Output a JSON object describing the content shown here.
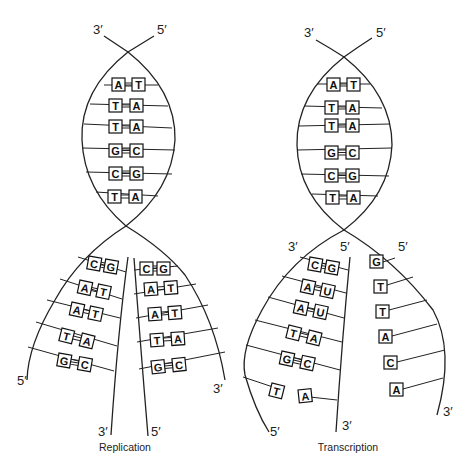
{
  "diagram": {
    "replication": {
      "caption": "Replication",
      "top_labels": {
        "left": "3′",
        "right": "5′"
      },
      "helix_pairs": [
        [
          "A",
          "T"
        ],
        [
          "T",
          "A"
        ],
        [
          "T",
          "A"
        ],
        [
          "G",
          "C"
        ],
        [
          "C",
          "G"
        ],
        [
          "T",
          "A"
        ]
      ],
      "left_fork": {
        "pairs": [
          [
            "C",
            "G"
          ],
          [
            "A",
            "T"
          ],
          [
            "A",
            "T"
          ],
          [
            "T",
            "A"
          ],
          [
            "G",
            "C"
          ]
        ],
        "outer_end_label": "5′",
        "inner_end_label": "3′"
      },
      "right_fork": {
        "pairs": [
          [
            "C",
            "G"
          ],
          [
            "A",
            "T"
          ],
          [
            "A",
            "T"
          ],
          [
            "T",
            "A"
          ],
          [
            "G",
            "C"
          ]
        ],
        "inner_end_label": "5′",
        "outer_end_label": "3′"
      }
    },
    "transcription": {
      "caption": "Transcription",
      "top_labels": {
        "left": "3′",
        "right": "5′"
      },
      "helix_pairs": [
        [
          "A",
          "T"
        ],
        [
          "T",
          "A"
        ],
        [
          "T",
          "A"
        ],
        [
          "G",
          "C"
        ],
        [
          "C",
          "G"
        ],
        [
          "T",
          "A"
        ]
      ],
      "left_fork": {
        "pairs": [
          [
            "C",
            "G"
          ],
          [
            "A",
            "U"
          ],
          [
            "A",
            "U"
          ],
          [
            "T",
            "A"
          ],
          [
            "G",
            "C"
          ],
          [
            "T",
            "A"
          ]
        ],
        "top_outer_label": "3′",
        "top_inner_label": "5′",
        "outer_end_label": "5′",
        "inner_end_label": "3′"
      },
      "right_fork": {
        "bases": [
          "G",
          "T",
          "T",
          "A",
          "C",
          "A"
        ],
        "top_label": "5′",
        "outer_end_label": "3′"
      }
    }
  }
}
